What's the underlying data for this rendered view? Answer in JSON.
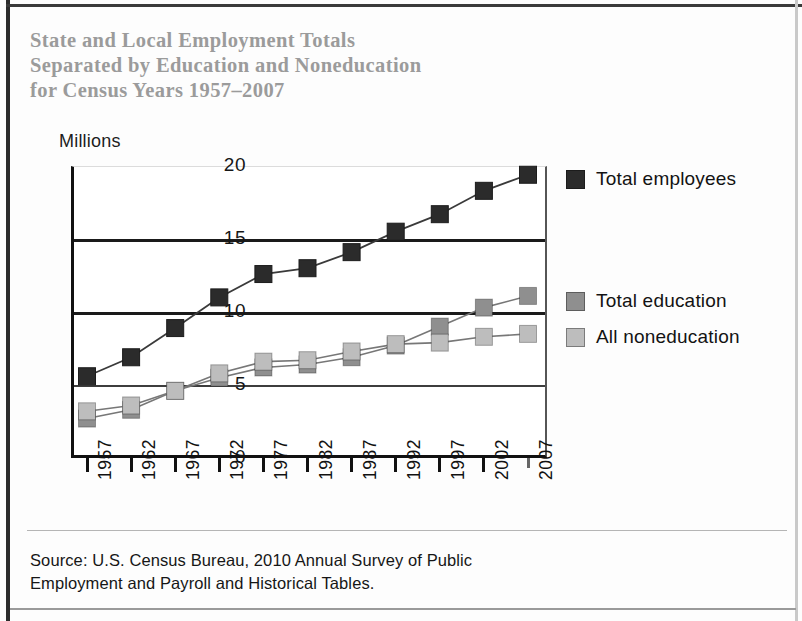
{
  "title": {
    "line1": "State and Local Employment Totals",
    "line2": "Separated by Education and Noneducation",
    "line3": "for Census Years 1957–2007",
    "color": "#9b9b9b"
  },
  "units_label": "Millions",
  "source": {
    "line1": "Source: U.S. Census Bureau, 2010 Annual Survey of Public",
    "line2": "Employment and Payroll and Historical Tables."
  },
  "legend": [
    {
      "label": "Total employees",
      "color": "#2b2b2b"
    },
    {
      "label": "Total education",
      "color": "#8f8f8f"
    },
    {
      "label": "All noneducation",
      "color": "#bdbdbd"
    }
  ],
  "chart_data": {
    "type": "line",
    "xlabel": "",
    "ylabel": "Millions",
    "ylim": [
      0,
      20
    ],
    "yticks": [
      0,
      5,
      10,
      15,
      20
    ],
    "ytick_labels": [
      "0",
      "5",
      "10",
      "15",
      "20"
    ],
    "grid": true,
    "legend_position": "right",
    "marker": "square",
    "categories": [
      "1957",
      "1962",
      "1967",
      "1972",
      "1977",
      "1982",
      "1987",
      "1992",
      "1997",
      "2002",
      "2007"
    ],
    "series": [
      {
        "name": "Total employees",
        "color": "#2b2b2b",
        "values": [
          5.6,
          6.9,
          8.9,
          11.0,
          12.6,
          13.0,
          14.1,
          15.5,
          16.7,
          18.3,
          19.4
        ]
      },
      {
        "name": "Total education",
        "color": "#8f8f8f",
        "values": [
          2.7,
          3.3,
          4.6,
          5.5,
          6.2,
          6.4,
          6.9,
          7.7,
          9.0,
          10.3,
          11.1
        ]
      },
      {
        "name": "All noneducation",
        "color": "#bdbdbd",
        "values": [
          3.2,
          3.6,
          4.6,
          5.8,
          6.6,
          6.7,
          7.3,
          7.8,
          7.9,
          8.3,
          8.5
        ]
      }
    ]
  }
}
